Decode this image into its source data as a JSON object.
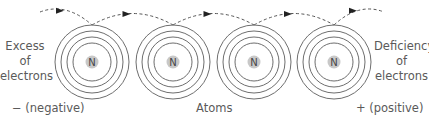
{
  "diagram": {
    "left_label": [
      "Excess",
      "of",
      "electrons"
    ],
    "right_label": [
      "Deficiency",
      "of",
      "electrons"
    ],
    "bottom_left": "− (negative)",
    "bottom_center": "Atoms",
    "bottom_right": "+ (positive)",
    "nucleus_symbol": "N",
    "atoms": [
      {
        "cx": 92,
        "cy": 62
      },
      {
        "cx": 173,
        "cy": 62
      },
      {
        "cx": 254,
        "cy": 62
      },
      {
        "cx": 334,
        "cy": 62
      }
    ],
    "shell_radii": [
      37,
      31,
      25,
      19
    ],
    "colors": {
      "shell": "#6e6e6e",
      "nucleus": "#c8c8c8",
      "arrow": "#444444",
      "text": "#5a5a5a"
    }
  }
}
